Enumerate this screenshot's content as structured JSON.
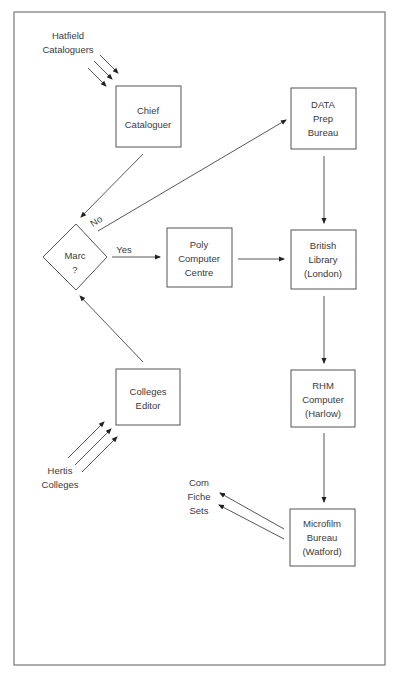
{
  "diagram": {
    "type": "flowchart",
    "nodes": [
      {
        "id": "chief",
        "lines": [
          "Chief",
          "Cataloguer"
        ]
      },
      {
        "id": "data_prep",
        "lines": [
          "DATA",
          "Prep",
          "Bureau"
        ]
      },
      {
        "id": "marc",
        "shape": "diamond",
        "lines": [
          "Marc",
          "?"
        ]
      },
      {
        "id": "poly",
        "lines": [
          "Poly",
          "Computer",
          "Centre"
        ]
      },
      {
        "id": "british_library",
        "lines": [
          "British",
          "Library",
          "(London)"
        ]
      },
      {
        "id": "colleges_editor",
        "lines": [
          "Colleges",
          "Editor"
        ]
      },
      {
        "id": "rhm",
        "lines": [
          "RHM",
          "Computer",
          "(Harlow)"
        ]
      },
      {
        "id": "microfilm",
        "lines": [
          "Microfilm",
          "Bureau",
          "(Watford)"
        ]
      }
    ],
    "sources": [
      {
        "id": "hatfield",
        "lines": [
          "Hatfield",
          "Cataloguers"
        ]
      },
      {
        "id": "hertis",
        "lines": [
          "Hertis",
          "Colleges"
        ]
      },
      {
        "id": "com_fiche",
        "lines": [
          "Com",
          "Fiche",
          "Sets"
        ]
      }
    ],
    "edge_labels": {
      "no": "No",
      "yes": "Yes"
    },
    "edges": [
      {
        "from": "hatfield",
        "to": "chief",
        "count": 3
      },
      {
        "from": "chief",
        "to": "marc"
      },
      {
        "from": "marc",
        "to": "data_prep",
        "label": "No"
      },
      {
        "from": "marc",
        "to": "poly",
        "label": "Yes"
      },
      {
        "from": "poly",
        "to": "british_library"
      },
      {
        "from": "data_prep",
        "to": "british_library"
      },
      {
        "from": "british_library",
        "to": "rhm"
      },
      {
        "from": "rhm",
        "to": "microfilm"
      },
      {
        "from": "microfilm",
        "to": "com_fiche",
        "count": 2
      },
      {
        "from": "colleges_editor",
        "to": "marc"
      },
      {
        "from": "hertis",
        "to": "colleges_editor",
        "count": 3
      }
    ]
  }
}
